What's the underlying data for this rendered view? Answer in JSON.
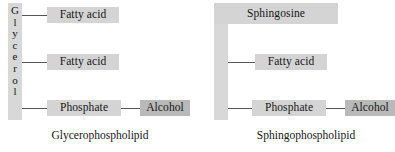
{
  "figure": {
    "type": "phospholipid-structure-comparison",
    "colors": {
      "node_fill": "#d4d4d4",
      "node_fill_dark": "#b9b9b9",
      "backbone_fill": "#d8d8d8",
      "connector": "#555555",
      "text": "#161616",
      "background": "#ffffff"
    }
  },
  "panels": [
    {
      "id": "glycerophospholipid",
      "caption": "Glycerophospholipid",
      "backbone": {
        "name": "Glycerol",
        "orientation": "vertical",
        "letters": [
          "G",
          "l",
          "y",
          "c",
          "e",
          "r",
          "o",
          "l"
        ]
      },
      "nodes": [
        {
          "id": "fatty-acid-1",
          "label": "Fatty acid",
          "shade": "light"
        },
        {
          "id": "fatty-acid-2",
          "label": "Fatty acid",
          "shade": "light"
        },
        {
          "id": "phosphate",
          "label": "Phosphate",
          "shade": "light"
        },
        {
          "id": "alcohol",
          "label": "Alcohol",
          "shade": "dark"
        }
      ]
    },
    {
      "id": "sphingophospholipid",
      "caption": "Sphingophospholipid",
      "backbone": {
        "name": "Sphingosine",
        "orientation": "L-shape",
        "letters": []
      },
      "nodes": [
        {
          "id": "sphingosine",
          "label": "Sphingosine",
          "shade": "light"
        },
        {
          "id": "fatty-acid",
          "label": "Fatty acid",
          "shade": "light"
        },
        {
          "id": "phosphate",
          "label": "Phosphate",
          "shade": "light"
        },
        {
          "id": "alcohol",
          "label": "Alcohol",
          "shade": "dark"
        }
      ]
    }
  ]
}
